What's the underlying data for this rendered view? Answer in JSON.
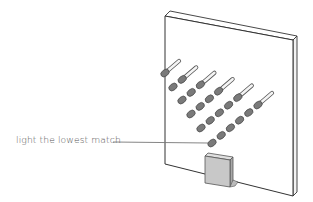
{
  "diagram": {
    "title": "",
    "annotation": {
      "text": "light the lowest match",
      "target": "lowest-match-head"
    },
    "board": {
      "description": "upright board with matches stuck into it in diagonal rows",
      "fill": "#ffffff",
      "stroke": "#333333"
    },
    "stand_block": {
      "fill": "#c8c8c8",
      "stroke": "#555555"
    },
    "match_rows": [
      {
        "row": 1,
        "match_count": 1
      },
      {
        "row": 2,
        "match_count": 2
      },
      {
        "row": 3,
        "match_count": 3
      },
      {
        "row": 4,
        "match_count": 4
      },
      {
        "row": 5,
        "match_count": 5
      },
      {
        "row": 6,
        "match_count": 6
      }
    ],
    "colors": {
      "match_head": "#7a7a7a",
      "match_head_outline": "#4a4a4a",
      "match_stick": "#f4f4f4",
      "leader_line": "#777777",
      "label_text": "#555555"
    }
  }
}
